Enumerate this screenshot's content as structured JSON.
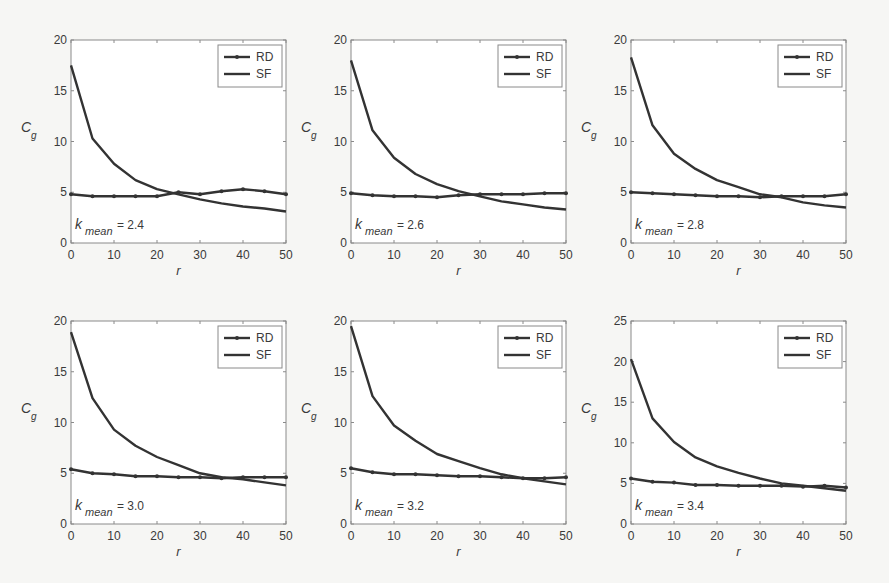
{
  "chart_data": [
    {
      "type": "line",
      "title": "",
      "annotation": {
        "var": "k",
        "sub": "mean",
        "value": "2.4"
      },
      "xlabel": "r",
      "ylabel": "C",
      "ylabel_sub": "g",
      "xlim": [
        0,
        50
      ],
      "ylim": [
        0,
        20
      ],
      "xticks": [
        0,
        10,
        20,
        30,
        40,
        50
      ],
      "yticks": [
        0,
        5,
        10,
        15,
        20
      ],
      "grid": false,
      "legend_position": "upper right",
      "x": [
        0,
        5,
        10,
        15,
        20,
        25,
        30,
        35,
        40,
        45,
        50
      ],
      "series": [
        {
          "name": "RD",
          "marker": true,
          "values": [
            4.8,
            4.6,
            4.6,
            4.6,
            4.6,
            5.0,
            4.8,
            5.1,
            5.3,
            5.1,
            4.8
          ]
        },
        {
          "name": "SF",
          "marker": false,
          "values": [
            17.5,
            10.3,
            7.8,
            6.2,
            5.3,
            4.8,
            4.3,
            3.9,
            3.6,
            3.4,
            3.1
          ]
        }
      ]
    },
    {
      "type": "line",
      "title": "",
      "annotation": {
        "var": "k",
        "sub": "mean",
        "value": "2.6"
      },
      "xlabel": "r",
      "ylabel": "C",
      "ylabel_sub": "g",
      "xlim": [
        0,
        50
      ],
      "ylim": [
        0,
        20
      ],
      "xticks": [
        0,
        10,
        20,
        30,
        40,
        50
      ],
      "yticks": [
        0,
        5,
        10,
        15,
        20
      ],
      "grid": false,
      "legend_position": "upper right",
      "x": [
        0,
        5,
        10,
        15,
        20,
        25,
        30,
        35,
        40,
        45,
        50
      ],
      "series": [
        {
          "name": "RD",
          "marker": true,
          "values": [
            4.9,
            4.7,
            4.6,
            4.6,
            4.5,
            4.7,
            4.8,
            4.8,
            4.8,
            4.9,
            4.9
          ]
        },
        {
          "name": "SF",
          "marker": false,
          "values": [
            18.0,
            11.1,
            8.4,
            6.8,
            5.8,
            5.1,
            4.6,
            4.1,
            3.8,
            3.5,
            3.3
          ]
        }
      ]
    },
    {
      "type": "line",
      "title": "",
      "annotation": {
        "var": "k",
        "sub": "mean",
        "value": "2.8"
      },
      "xlabel": "r",
      "ylabel": "C",
      "ylabel_sub": "g",
      "xlim": [
        0,
        50
      ],
      "ylim": [
        0,
        20
      ],
      "xticks": [
        0,
        10,
        20,
        30,
        40,
        50
      ],
      "yticks": [
        0,
        5,
        10,
        15,
        20
      ],
      "grid": false,
      "legend_position": "upper right",
      "x": [
        0,
        5,
        10,
        15,
        20,
        25,
        30,
        35,
        40,
        45,
        50
      ],
      "series": [
        {
          "name": "RD",
          "marker": true,
          "values": [
            5.0,
            4.9,
            4.8,
            4.7,
            4.6,
            4.6,
            4.5,
            4.6,
            4.6,
            4.6,
            4.8
          ]
        },
        {
          "name": "SF",
          "marker": false,
          "values": [
            18.3,
            11.6,
            8.8,
            7.3,
            6.2,
            5.5,
            4.8,
            4.5,
            4.0,
            3.7,
            3.5
          ]
        }
      ]
    },
    {
      "type": "line",
      "title": "",
      "annotation": {
        "var": "k",
        "sub": "mean",
        "value": "3.0"
      },
      "xlabel": "r",
      "ylabel": "C",
      "ylabel_sub": "g",
      "xlim": [
        0,
        50
      ],
      "ylim": [
        0,
        20
      ],
      "xticks": [
        0,
        10,
        20,
        30,
        40,
        50
      ],
      "yticks": [
        0,
        5,
        10,
        15,
        20
      ],
      "grid": false,
      "legend_position": "upper right",
      "x": [
        0,
        5,
        10,
        15,
        20,
        25,
        30,
        35,
        40,
        45,
        50
      ],
      "series": [
        {
          "name": "RD",
          "marker": true,
          "values": [
            5.4,
            5.0,
            4.9,
            4.7,
            4.7,
            4.6,
            4.6,
            4.5,
            4.6,
            4.6,
            4.6
          ]
        },
        {
          "name": "SF",
          "marker": false,
          "values": [
            18.9,
            12.4,
            9.3,
            7.7,
            6.6,
            5.8,
            5.0,
            4.6,
            4.4,
            4.1,
            3.8
          ]
        }
      ]
    },
    {
      "type": "line",
      "title": "",
      "annotation": {
        "var": "k",
        "sub": "mean",
        "value": "3.2"
      },
      "xlabel": "r",
      "ylabel": "C",
      "ylabel_sub": "g",
      "xlim": [
        0,
        50
      ],
      "ylim": [
        0,
        20
      ],
      "xticks": [
        0,
        10,
        20,
        30,
        40,
        50
      ],
      "yticks": [
        0,
        5,
        10,
        15,
        20
      ],
      "grid": false,
      "legend_position": "upper right",
      "x": [
        0,
        5,
        10,
        15,
        20,
        25,
        30,
        35,
        40,
        45,
        50
      ],
      "series": [
        {
          "name": "RD",
          "marker": true,
          "values": [
            5.5,
            5.1,
            4.9,
            4.9,
            4.8,
            4.7,
            4.7,
            4.6,
            4.5,
            4.5,
            4.6
          ]
        },
        {
          "name": "SF",
          "marker": false,
          "values": [
            19.5,
            12.6,
            9.7,
            8.2,
            6.9,
            6.2,
            5.5,
            4.9,
            4.5,
            4.2,
            3.9
          ]
        }
      ]
    },
    {
      "type": "line",
      "title": "",
      "annotation": {
        "var": "k",
        "sub": "mean",
        "value": "3.4"
      },
      "xlabel": "r",
      "ylabel": "C",
      "ylabel_sub": "g",
      "xlim": [
        0,
        50
      ],
      "ylim": [
        0,
        25
      ],
      "xticks": [
        0,
        10,
        20,
        30,
        40,
        50
      ],
      "yticks": [
        0,
        5,
        10,
        15,
        20,
        25
      ],
      "grid": false,
      "legend_position": "upper right",
      "x": [
        0,
        5,
        10,
        15,
        20,
        25,
        30,
        35,
        40,
        45,
        50
      ],
      "series": [
        {
          "name": "RD",
          "marker": true,
          "values": [
            5.6,
            5.2,
            5.1,
            4.8,
            4.8,
            4.7,
            4.7,
            4.7,
            4.6,
            4.7,
            4.5
          ]
        },
        {
          "name": "SF",
          "marker": false,
          "values": [
            20.3,
            13.0,
            10.1,
            8.2,
            7.1,
            6.3,
            5.6,
            5.0,
            4.7,
            4.4,
            4.1
          ]
        }
      ]
    }
  ],
  "style": {
    "line_color": "#333333",
    "axis_color": "#8a8a8a",
    "text_color": "#3a3a3a",
    "background": "#f6f6f4",
    "plot_background": "#ffffff"
  }
}
